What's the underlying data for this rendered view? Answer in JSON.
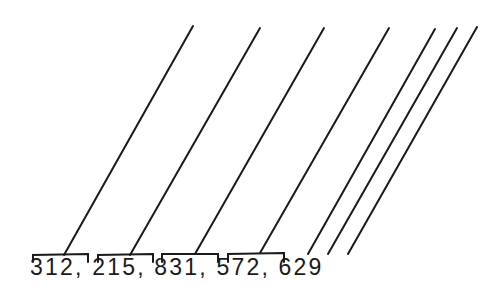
{
  "diagram": {
    "number_text": "312, 215, 831, 572, 629",
    "groups": [
      {
        "label": "312"
      },
      {
        "label": "215"
      },
      {
        "label": "831"
      },
      {
        "label": "572"
      },
      {
        "label": "629"
      }
    ],
    "line_color": "#1a1a1a"
  }
}
